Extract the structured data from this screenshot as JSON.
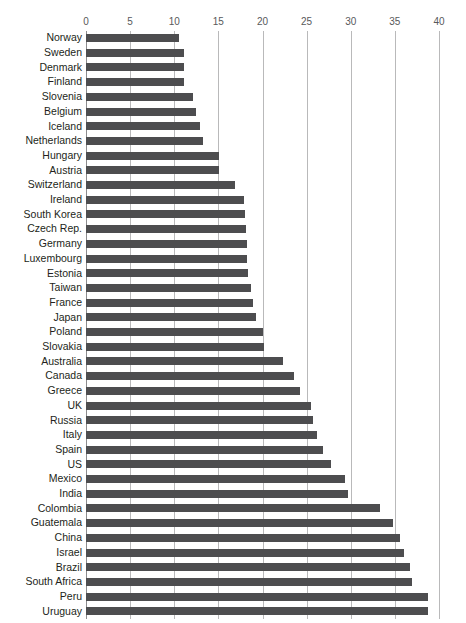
{
  "chart_data": {
    "type": "bar",
    "orientation": "horizontal",
    "title": "",
    "xlabel": "",
    "ylabel": "",
    "xlim": [
      0,
      40
    ],
    "xticks": [
      0,
      5,
      10,
      15,
      20,
      25,
      30,
      35,
      40
    ],
    "grid": true,
    "legend": "none",
    "bar_color": "#4d4d4f",
    "grid_color": "#b9b9ba",
    "categories": [
      "Norway",
      "Sweden",
      "Denmark",
      "Finland",
      "Slovenia",
      "Belgium",
      "Iceland",
      "Netherlands",
      "Hungary",
      "Austria",
      "Switzerland",
      "Ireland",
      "South Korea",
      "Czech Rep.",
      "Germany",
      "Luxembourg",
      "Estonia",
      "Taiwan",
      "France",
      "Japan",
      "Poland",
      "Slovakia",
      "Australia",
      "Canada",
      "Greece",
      "UK",
      "Russia",
      "Italy",
      "Spain",
      "US",
      "Mexico",
      "India",
      "Colombia",
      "Guatemala",
      "China",
      "Israel",
      "Brazil",
      "South Africa",
      "Peru",
      "Uruguay"
    ],
    "values": [
      10.5,
      11.1,
      11.1,
      11.1,
      12.1,
      12.5,
      12.9,
      13.3,
      15.1,
      15.1,
      16.9,
      17.9,
      18.0,
      18.1,
      18.2,
      18.3,
      18.4,
      18.7,
      18.9,
      19.3,
      20.1,
      20.2,
      22.3,
      23.6,
      24.2,
      25.5,
      25.7,
      26.2,
      26.9,
      27.8,
      29.4,
      29.7,
      33.3,
      34.8,
      35.6,
      36.0,
      36.7,
      36.9,
      38.7,
      38.8
    ]
  }
}
